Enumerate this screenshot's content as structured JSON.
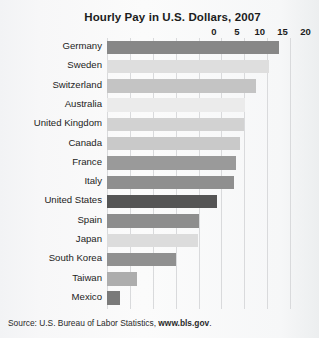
{
  "chart_data": {
    "type": "bar",
    "orientation": "horizontal",
    "title": "Hourly Pay in U.S. Dollars, 2007",
    "xlabel": "",
    "ylabel": "",
    "xlim": [
      0,
      40
    ],
    "xticks": [
      0,
      5,
      10,
      15,
      20,
      25,
      30,
      35,
      40
    ],
    "grid": true,
    "legend": null,
    "categories": [
      "Germany",
      "Sweden",
      "Switzerland",
      "Australia",
      "United Kingdom",
      "Canada",
      "France",
      "Italy",
      "United States",
      "Spain",
      "Japan",
      "South Korea",
      "Taiwan",
      "Mexico"
    ],
    "values": [
      37.7,
      35.5,
      32.5,
      30.2,
      30.0,
      29.0,
      28.2,
      27.8,
      24.0,
      20.0,
      19.8,
      15.0,
      6.6,
      2.9
    ],
    "bar_colors": [
      "#878787",
      "#dedede",
      "#c4c4c4",
      "#ebebeb",
      "#d2d2d2",
      "#c9c9c9",
      "#9a9a9a",
      "#8f8f8f",
      "#555555",
      "#8d8d8d",
      "#dcdcdc",
      "#909090",
      "#adadad",
      "#7a7a7a"
    ],
    "highlight_category": "United States"
  },
  "source": {
    "prefix": "Source: U.S. Bureau of Labor Statistics, ",
    "link": "www.bls.gov",
    "suffix": "."
  },
  "colors": {
    "gridline": "#d9dadc",
    "text": "#1c1c1c",
    "background": "#f7f7f8"
  }
}
